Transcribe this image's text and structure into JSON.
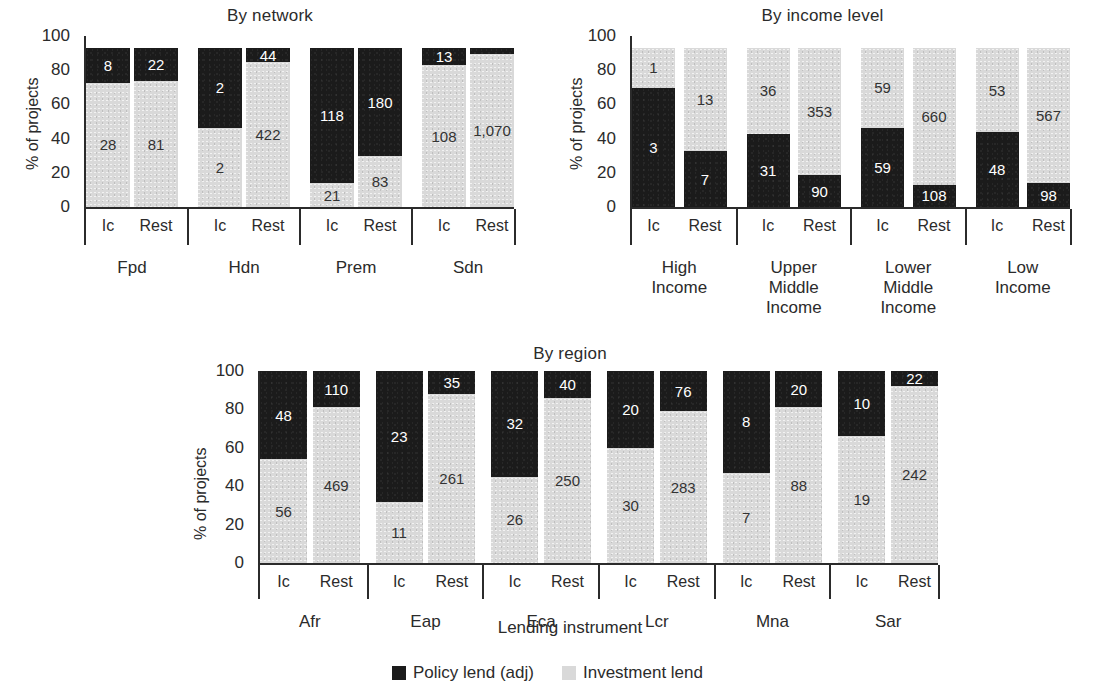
{
  "figure": {
    "axis_title": "Lending instrument",
    "y_axis_label": "% of projects",
    "y_ticks": [
      "100",
      "80",
      "60",
      "40",
      "20",
      "0"
    ],
    "legend": {
      "items": [
        {
          "label": "Policy lend (adj)",
          "color": "#1b1b1b",
          "swatch": "black-square-swatch"
        },
        {
          "label": "Investment lend",
          "color": "#d9d9d9",
          "swatch": "gray-square-swatch"
        }
      ]
    },
    "colors": {
      "policy": "#1b1b1b",
      "investment": "#d9d9d9",
      "axis": "#2b2b2b",
      "background": "#ffffff"
    }
  },
  "chart_data": [
    {
      "type": "bar",
      "title": "By network",
      "xlabel": "Lending instrument",
      "ylabel": "% of projects",
      "ylim": [
        0,
        100
      ],
      "grid": false,
      "stacked": true,
      "normalized": "percent",
      "stack_order": "policy-on-top",
      "bar_max_percent": 93,
      "legend_position": "bottom",
      "groups": [
        "Fpd",
        "Hdn",
        "Prem",
        "Sdn"
      ],
      "subcategories": [
        "Ic",
        "Rest"
      ],
      "series": [
        {
          "name": "Policy lend (adj)",
          "values": [
            8,
            22,
            2,
            44,
            118,
            180,
            13,
            5
          ]
        },
        {
          "name": "Investment lend",
          "values": [
            28,
            81,
            2,
            422,
            21,
            83,
            108,
            1070
          ]
        }
      ],
      "bars": [
        {
          "group": "Fpd",
          "sub": "Ic",
          "policy": 8,
          "investment": 28,
          "policy_label": "8",
          "investment_label": "28",
          "policy_pct": 22,
          "investment_pct": 78
        },
        {
          "group": "Fpd",
          "sub": "Rest",
          "policy": 22,
          "investment": 81,
          "policy_label": "22",
          "investment_label": "81",
          "policy_pct": 21,
          "investment_pct": 79
        },
        {
          "group": "Hdn",
          "sub": "Ic",
          "policy": 2,
          "investment": 2,
          "policy_label": "2",
          "investment_label": "2",
          "policy_pct": 50,
          "investment_pct": 50
        },
        {
          "group": "Hdn",
          "sub": "Rest",
          "policy": 44,
          "investment": 422,
          "policy_label": "44",
          "investment_label": "422",
          "policy_pct": 9,
          "investment_pct": 91
        },
        {
          "group": "Prem",
          "sub": "Ic",
          "policy": 118,
          "investment": 21,
          "policy_label": "118",
          "investment_label": "21",
          "policy_pct": 85,
          "investment_pct": 15
        },
        {
          "group": "Prem",
          "sub": "Rest",
          "policy": 180,
          "investment": 83,
          "policy_label": "180",
          "investment_label": "83",
          "policy_pct": 68,
          "investment_pct": 32
        },
        {
          "group": "Sdn",
          "sub": "Ic",
          "policy": 13,
          "investment": 108,
          "policy_label": "13",
          "investment_label": "108",
          "policy_pct": 11,
          "investment_pct": 89
        },
        {
          "group": "Sdn",
          "sub": "Rest",
          "policy": null,
          "investment": 1070,
          "policy_label": "",
          "investment_label": "1,070",
          "policy_pct": 4,
          "investment_pct": 96
        }
      ]
    },
    {
      "type": "bar",
      "title": "By income level",
      "xlabel": "Lending instrument",
      "ylabel": "% of projects",
      "ylim": [
        0,
        100
      ],
      "grid": false,
      "stacked": true,
      "normalized": "percent",
      "stack_order": "policy-on-bottom",
      "bar_max_percent": 93,
      "legend_position": "bottom",
      "groups": [
        "High\nIncome",
        "Upper\nMiddle\nIncome",
        "Lower\nMiddle\nIncome",
        "Low\nIncome"
      ],
      "subcategories": [
        "Ic",
        "Rest"
      ],
      "series": [
        {
          "name": "Policy lend (adj)",
          "values": [
            3,
            7,
            31,
            90,
            59,
            108,
            48,
            98
          ]
        },
        {
          "name": "Investment lend",
          "values": [
            1,
            13,
            36,
            353,
            59,
            660,
            53,
            567
          ]
        }
      ],
      "bars": [
        {
          "group": "High Income",
          "sub": "Ic",
          "policy": 3,
          "investment": 1,
          "policy_label": "3",
          "investment_label": "1",
          "policy_pct": 75,
          "investment_pct": 25
        },
        {
          "group": "High Income",
          "sub": "Rest",
          "policy": 7,
          "investment": 13,
          "policy_label": "7",
          "investment_label": "13",
          "policy_pct": 35,
          "investment_pct": 65
        },
        {
          "group": "Upper Middle Income",
          "sub": "Ic",
          "policy": 31,
          "investment": 36,
          "policy_label": "31",
          "investment_label": "36",
          "policy_pct": 46,
          "investment_pct": 54
        },
        {
          "group": "Upper Middle Income",
          "sub": "Rest",
          "policy": 90,
          "investment": 353,
          "policy_label": "90",
          "investment_label": "353",
          "policy_pct": 20,
          "investment_pct": 80
        },
        {
          "group": "Lower Middle Income",
          "sub": "Ic",
          "policy": 59,
          "investment": 59,
          "policy_label": "59",
          "investment_label": "59",
          "policy_pct": 50,
          "investment_pct": 50
        },
        {
          "group": "Lower Middle Income",
          "sub": "Rest",
          "policy": 108,
          "investment": 660,
          "policy_label": "108",
          "investment_label": "660",
          "policy_pct": 14,
          "investment_pct": 86
        },
        {
          "group": "Low Income",
          "sub": "Ic",
          "policy": 48,
          "investment": 53,
          "policy_label": "48",
          "investment_label": "53",
          "policy_pct": 47,
          "investment_pct": 53
        },
        {
          "group": "Low Income",
          "sub": "Rest",
          "policy": 98,
          "investment": 567,
          "policy_label": "98",
          "investment_label": "567",
          "policy_pct": 15,
          "investment_pct": 85
        }
      ]
    },
    {
      "type": "bar",
      "title": "By region",
      "xlabel": "Lending instrument",
      "ylabel": "% of projects",
      "ylim": [
        0,
        100
      ],
      "grid": false,
      "stacked": true,
      "normalized": "percent",
      "stack_order": "policy-on-top",
      "bar_max_percent": 100,
      "legend_position": "bottom",
      "groups": [
        "Afr",
        "Eap",
        "Eca",
        "Lcr",
        "Mna",
        "Sar"
      ],
      "subcategories": [
        "Ic",
        "Rest"
      ],
      "series": [
        {
          "name": "Policy lend (adj)",
          "values": [
            48,
            110,
            23,
            35,
            32,
            40,
            20,
            76,
            8,
            20,
            10,
            22
          ]
        },
        {
          "name": "Investment lend",
          "values": [
            56,
            469,
            11,
            261,
            26,
            250,
            30,
            283,
            7,
            88,
            19,
            242
          ]
        }
      ],
      "bars": [
        {
          "group": "Afr",
          "sub": "Ic",
          "policy": 48,
          "investment": 56,
          "policy_label": "48",
          "investment_label": "56",
          "policy_pct": 46,
          "investment_pct": 54
        },
        {
          "group": "Afr",
          "sub": "Rest",
          "policy": 110,
          "investment": 469,
          "policy_label": "110",
          "investment_label": "469",
          "policy_pct": 19,
          "investment_pct": 81
        },
        {
          "group": "Eap",
          "sub": "Ic",
          "policy": 23,
          "investment": 11,
          "policy_label": "23",
          "investment_label": "11",
          "policy_pct": 68,
          "investment_pct": 32
        },
        {
          "group": "Eap",
          "sub": "Rest",
          "policy": 35,
          "investment": 261,
          "policy_label": "35",
          "investment_label": "261",
          "policy_pct": 12,
          "investment_pct": 88
        },
        {
          "group": "Eca",
          "sub": "Ic",
          "policy": 32,
          "investment": 26,
          "policy_label": "32",
          "investment_label": "26",
          "policy_pct": 55,
          "investment_pct": 45
        },
        {
          "group": "Eca",
          "sub": "Rest",
          "policy": 40,
          "investment": 250,
          "policy_label": "40",
          "investment_label": "250",
          "policy_pct": 14,
          "investment_pct": 86
        },
        {
          "group": "Lcr",
          "sub": "Ic",
          "policy": 20,
          "investment": 30,
          "policy_label": "20",
          "investment_label": "30",
          "policy_pct": 40,
          "investment_pct": 60
        },
        {
          "group": "Lcr",
          "sub": "Rest",
          "policy": 76,
          "investment": 283,
          "policy_label": "76",
          "investment_label": "283",
          "policy_pct": 21,
          "investment_pct": 79
        },
        {
          "group": "Mna",
          "sub": "Ic",
          "policy": 8,
          "investment": 7,
          "policy_label": "8",
          "investment_label": "7",
          "policy_pct": 53,
          "investment_pct": 47
        },
        {
          "group": "Mna",
          "sub": "Rest",
          "policy": 20,
          "investment": 88,
          "policy_label": "20",
          "investment_label": "88",
          "policy_pct": 19,
          "investment_pct": 81
        },
        {
          "group": "Sar",
          "sub": "Ic",
          "policy": 10,
          "investment": 19,
          "policy_label": "10",
          "investment_label": "19",
          "policy_pct": 34,
          "investment_pct": 66
        },
        {
          "group": "Sar",
          "sub": "Rest",
          "policy": 22,
          "investment": 242,
          "policy_label": "22",
          "investment_label": "242",
          "policy_pct": 8,
          "investment_pct": 92
        }
      ]
    }
  ]
}
